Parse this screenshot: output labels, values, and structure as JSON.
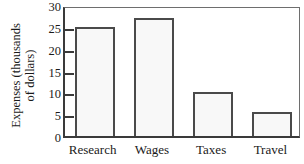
{
  "chart_data": {
    "type": "bar",
    "title": "",
    "xlabel": "",
    "ylabel": "Expenses (thousands of dollars)",
    "ylabel_line1": "Expenses (thousands",
    "ylabel_line2": "of dollars)",
    "categories": [
      "Research",
      "Wages",
      "Taxes",
      "Travel"
    ],
    "values": [
      25,
      27,
      10,
      5.5
    ],
    "ylim": [
      0,
      30
    ],
    "ytick_values": [
      0,
      5,
      10,
      15,
      20,
      25,
      30
    ],
    "ytick_labels": [
      "0",
      "5",
      "10",
      "15",
      "20",
      "25",
      "30"
    ],
    "grid": false,
    "legend": false,
    "bar_fill_color": "#f8f8f8",
    "bar_border_color": "#4a4a4a",
    "axis_color": "#3a3a3a",
    "background_color": "#ffffff"
  }
}
